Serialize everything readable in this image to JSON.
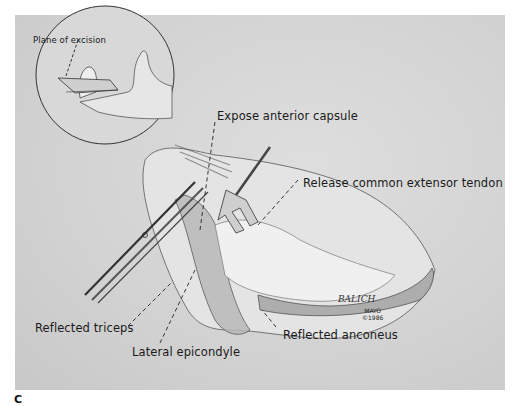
{
  "figure": {
    "inset": {
      "label": "Plane of excision"
    },
    "labels": {
      "expose_anterior_capsule": "Expose anterior capsule",
      "release_common_extensor_tendon": "Release common extensor tendon",
      "reflected_triceps": "Reflected triceps",
      "lateral_epicondyle": "Lateral epicondyle",
      "reflected_anconeus": "Reflected anconeus"
    },
    "signature": {
      "artist": "BALICH",
      "institution": "MAYO",
      "copyright": "©1986"
    },
    "panel_letter": "C"
  },
  "colors": {
    "background": "#d4d4d4",
    "ink": "#1a1a1a",
    "page": "#ffffff"
  }
}
